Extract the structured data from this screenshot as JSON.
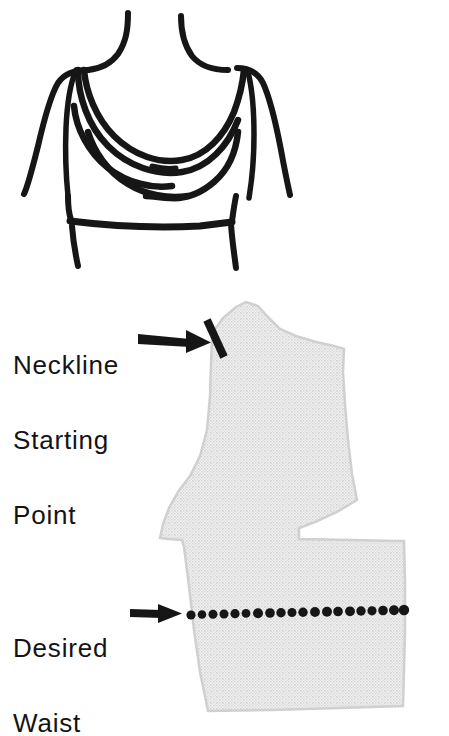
{
  "figure": {
    "kind": "sewing-pattern-instruction-diagram",
    "background_color": "#ffffff",
    "ink_color": "#161616",
    "pattern_fill_color": "#e7e7e7",
    "pattern_fill_dot_color": "#b9b9b9",
    "width": 449,
    "height": 724
  },
  "garment_sketch": {
    "name": "cowl-neck-bodice-sketch",
    "description": "Hand-drawn front view of a sleeveless bodice with a draped cowl neckline and a horizontal waistband",
    "drape_line_count": 4
  },
  "pattern_piece": {
    "name": "bodice-front-pattern-piece",
    "description": "Shaded pattern piece with slanted shoulder edge, armhole curve, a wedge-shaped dart opening on the right side, and a dotted waist line",
    "has_dart_notch": true,
    "dot_count": 20
  },
  "annotations": {
    "neckline": {
      "label_lines": [
        "Neckline",
        "Starting",
        "Point"
      ],
      "arrow": "arrow-right",
      "marker": "short-diagonal-tick"
    },
    "waist": {
      "label_lines": [
        "Desired",
        "Waist"
      ],
      "arrow": "arrow-right",
      "marker": "dotted-line"
    }
  }
}
